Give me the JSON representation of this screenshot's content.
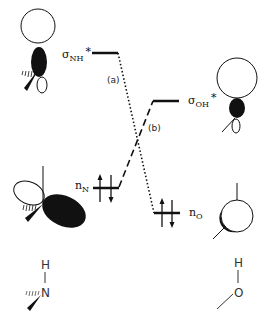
{
  "diagram": {
    "type": "molecular-orbital-interaction",
    "levels": {
      "sigma_NH_star": {
        "symbol": "σ",
        "subscript": "NH",
        "superscript": "*"
      },
      "sigma_OH_star": {
        "symbol": "σ",
        "subscript": "OH",
        "superscript": "*"
      },
      "n_N": {
        "symbol": "n",
        "subscript": "N",
        "electrons": 2
      },
      "n_O": {
        "symbol": "n",
        "subscript": "O",
        "electrons": 2
      }
    },
    "interactions": [
      {
        "label": "(a)",
        "from": "sigma_NH_star",
        "to": "n_O",
        "style": "dotted"
      },
      {
        "label": "(b)",
        "from": "n_N",
        "to": "sigma_OH_star",
        "style": "dashed"
      }
    ],
    "molecules": {
      "left": {
        "atom": "N",
        "substituent": "H"
      },
      "right": {
        "atom": "O",
        "substituent": "H"
      }
    }
  }
}
